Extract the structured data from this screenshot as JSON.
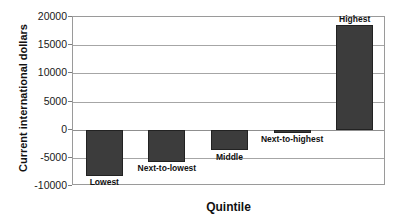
{
  "chart_data": {
    "type": "bar",
    "title": "",
    "xlabel": "Quintile",
    "ylabel": "Current international dollars",
    "categories": [
      "Lowest",
      "Next-to-lowest",
      "Middle",
      "Next-to-highest",
      "Highest"
    ],
    "values": [
      -8200,
      -5700,
      -3700,
      -500,
      18500
    ],
    "ylim": [
      -10000,
      20000
    ],
    "yticks": [
      20000,
      15000,
      10000,
      5000,
      0,
      -5000,
      -10000
    ],
    "ytick_labels": [
      "20000",
      "15000",
      "10000",
      "5000",
      "0",
      "-5000",
      "-10000"
    ],
    "grid": true,
    "legend": false,
    "bar_color": "#3c3c3c",
    "bar_border_color": "#222222",
    "grid_color": "#a6a6a6",
    "frame_color": "#9a9a9a"
  }
}
